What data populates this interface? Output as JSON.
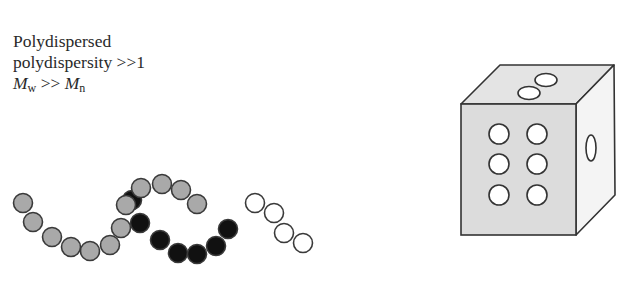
{
  "caption": {
    "line1": "Polydispersed",
    "line2": "polydispersity >>1",
    "line3": {
      "m": "M",
      "sub_w": "w",
      "op": " >> ",
      "m2": "M",
      "sub_n": "n"
    }
  },
  "chains": [
    {
      "name": "gray-chain",
      "fill": "#a9a9a9",
      "beads": [
        [
          23,
          203
        ],
        [
          33,
          222
        ],
        [
          52,
          237
        ],
        [
          71,
          247
        ],
        [
          90,
          251
        ],
        [
          110,
          245
        ],
        [
          121,
          228
        ],
        [
          126,
          205
        ],
        [
          141,
          188
        ],
        [
          162,
          184
        ],
        [
          181,
          190
        ],
        [
          197,
          204
        ]
      ]
    },
    {
      "name": "black-chain",
      "fill": "#111111",
      "beads": [
        [
          132,
          200
        ],
        [
          140,
          223
        ],
        [
          160,
          240
        ],
        [
          178,
          253
        ],
        [
          197,
          254
        ],
        [
          216,
          246
        ],
        [
          228,
          229
        ]
      ]
    },
    {
      "name": "white-chain",
      "fill": "#ffffff",
      "beads": [
        [
          255,
          203
        ],
        [
          274,
          213
        ],
        [
          284,
          233
        ],
        [
          303,
          243
        ]
      ]
    }
  ],
  "die": {
    "front_face_color": "#dcdcdc",
    "top_face_color": "#e2e2e2",
    "side_face_color": "#f2f2f2",
    "front_pips": [
      [
        499,
        134
      ],
      [
        537,
        134
      ],
      [
        499,
        164
      ],
      [
        537,
        164
      ],
      [
        499,
        195
      ],
      [
        537,
        195
      ]
    ],
    "top_pips": [
      [
        546,
        80
      ],
      [
        529,
        93
      ]
    ],
    "side_pips": [
      [
        591,
        148
      ]
    ]
  }
}
